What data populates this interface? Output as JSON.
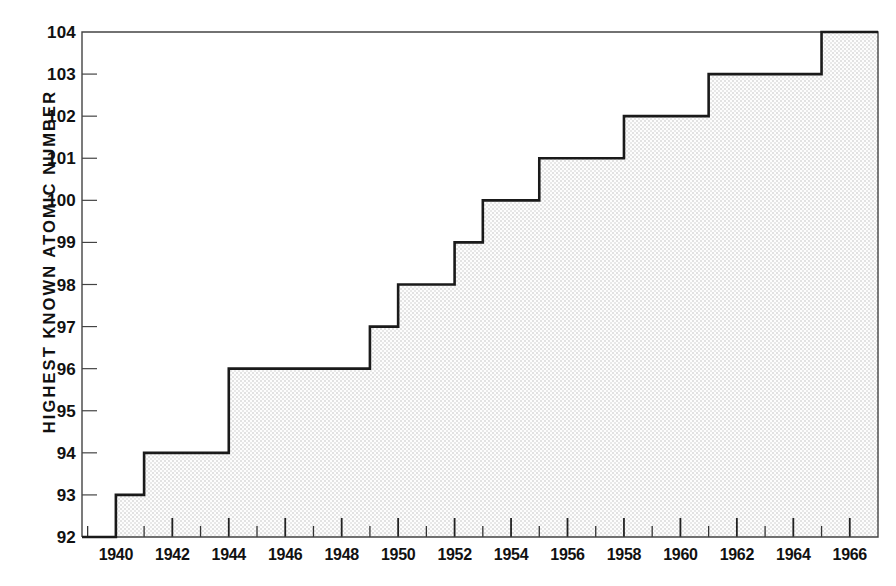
{
  "chart_data": {
    "type": "line",
    "subtype": "step-area",
    "title": "",
    "xlabel": "",
    "ylabel": "HIGHEST KNOWN ATOMIC NUMBER",
    "xlim": [
      1938.8,
      1967.0
    ],
    "ylim": [
      92,
      104
    ],
    "grid": false,
    "legend": null,
    "x_major_ticks": [
      1940,
      1942,
      1944,
      1946,
      1948,
      1950,
      1952,
      1954,
      1956,
      1958,
      1960,
      1962,
      1964,
      1966
    ],
    "x_major_tick_labels": [
      "1940",
      "1942",
      "1944",
      "1946",
      "1948",
      "1950",
      "1952",
      "1954",
      "1956",
      "1958",
      "1960",
      "1962",
      "1964",
      "1966"
    ],
    "x_minor_ticks": [
      1939,
      1941,
      1943,
      1945,
      1947,
      1949,
      1951,
      1953,
      1955,
      1957,
      1959,
      1961,
      1963,
      1965
    ],
    "y_ticks": [
      92,
      93,
      94,
      95,
      96,
      97,
      98,
      99,
      100,
      101,
      102,
      103,
      104
    ],
    "y_tick_labels": [
      "92",
      "93",
      "94",
      "95",
      "96",
      "97",
      "98",
      "99",
      "100",
      "101",
      "102",
      "103",
      "104"
    ],
    "x": [
      1940,
      1941,
      1944,
      1949,
      1950,
      1952,
      1953,
      1955,
      1958,
      1961,
      1965
    ],
    "values": [
      93,
      94,
      96,
      97,
      98,
      99,
      100,
      101,
      102,
      103,
      104
    ],
    "steps": [
      {
        "year": 1940,
        "atomic_number": 93
      },
      {
        "year": 1941,
        "atomic_number": 94
      },
      {
        "year": 1944,
        "atomic_number": 96
      },
      {
        "year": 1949,
        "atomic_number": 97
      },
      {
        "year": 1950,
        "atomic_number": 98
      },
      {
        "year": 1952,
        "atomic_number": 99
      },
      {
        "year": 1953,
        "atomic_number": 100
      },
      {
        "year": 1955,
        "atomic_number": 101
      },
      {
        "year": 1958,
        "atomic_number": 102
      },
      {
        "year": 1961,
        "atomic_number": 103
      },
      {
        "year": 1965,
        "atomic_number": 104
      }
    ],
    "colors": {
      "line": "#1a1a1a",
      "fill": "#ededed",
      "axis": "#444444",
      "text": "#111111",
      "background": "#ffffff"
    }
  }
}
